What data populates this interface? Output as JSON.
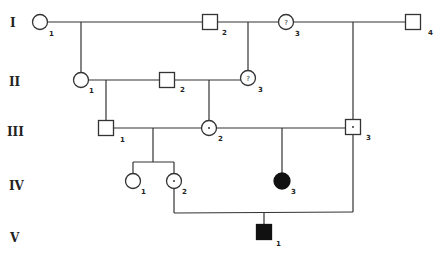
{
  "diagram": {
    "type": "pedigree",
    "generations": [
      {
        "label": "I"
      },
      {
        "label": "II"
      },
      {
        "label": "III"
      },
      {
        "label": "IV"
      },
      {
        "label": "V"
      }
    ],
    "individuals": {
      "I1": {
        "id": "1",
        "sex": "female",
        "status": "unaffected"
      },
      "I2": {
        "id": "2",
        "sex": "male",
        "status": "unaffected"
      },
      "I3": {
        "id": "3",
        "sex": "female",
        "status": "unknown",
        "mark": "?"
      },
      "I4": {
        "id": "4",
        "sex": "male",
        "status": "unaffected"
      },
      "II1": {
        "id": "1",
        "sex": "female",
        "status": "unaffected"
      },
      "II2": {
        "id": "2",
        "sex": "male",
        "status": "unaffected"
      },
      "II3": {
        "id": "3",
        "sex": "female",
        "status": "unknown",
        "mark": "?"
      },
      "III1": {
        "id": "1",
        "sex": "male",
        "status": "unaffected"
      },
      "III2": {
        "id": "2",
        "sex": "female",
        "status": "carrier",
        "mark": "·"
      },
      "III3": {
        "id": "3",
        "sex": "male",
        "status": "carrier",
        "mark": "·"
      },
      "IV1": {
        "id": "1",
        "sex": "female",
        "status": "unaffected"
      },
      "IV2": {
        "id": "2",
        "sex": "female",
        "status": "carrier",
        "mark": "·"
      },
      "IV3": {
        "id": "3",
        "sex": "female",
        "status": "affected"
      },
      "V1": {
        "id": "1",
        "sex": "male",
        "status": "affected"
      }
    },
    "unions": [
      {
        "partners": [
          "I1",
          "I2"
        ],
        "children": [
          "II1"
        ]
      },
      {
        "partners": [
          "I2",
          "I3"
        ],
        "children": [
          "II3"
        ]
      },
      {
        "partners": [
          "I3",
          "I4"
        ],
        "children": [
          "III3"
        ]
      },
      {
        "partners": [
          "II1",
          "II2"
        ],
        "children": [
          "III1"
        ]
      },
      {
        "partners": [
          "II2",
          "II3"
        ],
        "children": [
          "III2"
        ]
      },
      {
        "partners": [
          "III1",
          "III2"
        ],
        "children": [
          "IV1",
          "IV2"
        ]
      },
      {
        "partners": [
          "III2",
          "III3"
        ],
        "children": [
          "IV3"
        ]
      },
      {
        "partners": [
          "IV2",
          "III3"
        ],
        "children": [
          "V1"
        ]
      }
    ]
  }
}
